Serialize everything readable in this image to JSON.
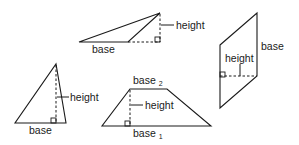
{
  "figure": {
    "shapes": [
      {
        "name": "obtuse-triangle",
        "labels": {
          "base": "base",
          "height": "height"
        }
      },
      {
        "name": "parallelogram",
        "labels": {
          "base": "base",
          "height": "height"
        }
      },
      {
        "name": "acute-triangle",
        "labels": {
          "base": "base",
          "height": "height"
        }
      },
      {
        "name": "trapezoid",
        "labels": {
          "base_top": "base",
          "base_top_sub": "2",
          "base_bottom": "base",
          "base_bottom_sub": "1",
          "height": "height"
        }
      }
    ],
    "colors": {
      "stroke": "#1a1a1a",
      "background": "#ffffff"
    }
  }
}
